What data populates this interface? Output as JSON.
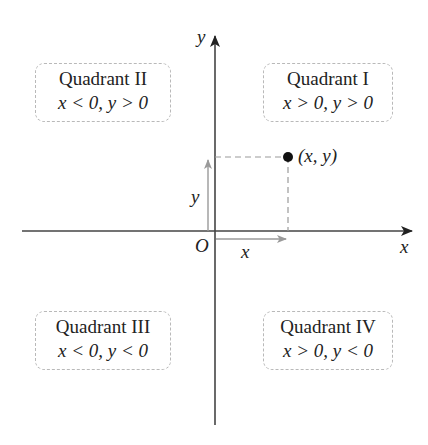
{
  "diagram": {
    "axes": {
      "x_label": "x",
      "y_label": "y",
      "origin_label": "O"
    },
    "point": {
      "label": "(x, y)",
      "x_component_label": "x",
      "y_component_label": "y"
    },
    "quadrants": [
      {
        "name": "Quadrant I",
        "condition": "x > 0, y > 0"
      },
      {
        "name": "Quadrant II",
        "condition": "x < 0, y > 0"
      },
      {
        "name": "Quadrant III",
        "condition": "x < 0, y < 0"
      },
      {
        "name": "Quadrant IV",
        "condition": "x > 0, y < 0"
      }
    ],
    "colors": {
      "axis": "#333333",
      "component_arrow": "#9a9a9a",
      "dashed_guide": "#9a9a9a",
      "box_border": "#b9b9b9"
    }
  }
}
